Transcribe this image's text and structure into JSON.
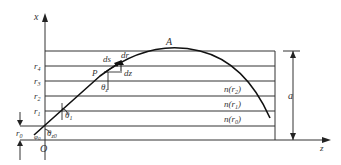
{
  "diagram": {
    "axes": {
      "vertical": "x",
      "horizontal": "z",
      "origin": "O"
    },
    "layer_labels": [
      "r4",
      "r3",
      "r2",
      "r1",
      "r0"
    ],
    "layer_label_display": [
      {
        "base": "r",
        "sub": "4"
      },
      {
        "base": "r",
        "sub": "3"
      },
      {
        "base": "r",
        "sub": "2"
      },
      {
        "base": "r",
        "sub": "1"
      },
      {
        "base": "r",
        "sub": "0"
      }
    ],
    "index_labels": [
      {
        "base": "n(r",
        "sub": "2",
        "close": ")"
      },
      {
        "base": "n(r",
        "sub": "1",
        "close": ")"
      },
      {
        "base": "n(r",
        "sub": "0",
        "close": ")"
      }
    ],
    "point_P": "P",
    "point_A": "A",
    "ds": "ds",
    "dr": "dr",
    "dz": "dz",
    "theta_z": {
      "base": "θ",
      "sub": "z"
    },
    "theta_1": {
      "base": "θ",
      "sub": "1"
    },
    "theta_z0": {
      "base": "θ",
      "sub": "z0"
    },
    "phi_0": {
      "base": "φ",
      "sub": "0"
    },
    "dimension_a": "a"
  }
}
